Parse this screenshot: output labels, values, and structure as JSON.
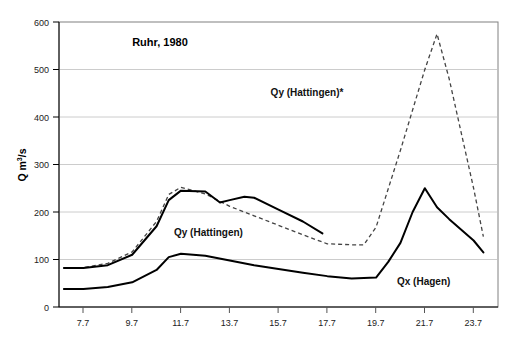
{
  "chart_data": {
    "type": "line",
    "title": "Ruhr, 1980",
    "xlabel": "",
    "ylabel": "Q m3/s",
    "ylabel_base": "Q m",
    "ylabel_sup": "3",
    "ylabel_tail": "/s",
    "xlim": [
      6.7,
      24.7
    ],
    "ylim": [
      0,
      600
    ],
    "y_ticks": [
      0,
      100,
      200,
      300,
      400,
      500,
      600
    ],
    "y_tick_labels": [
      "0",
      "100",
      "200",
      "300",
      "400",
      "500",
      "600"
    ],
    "x_ticks": [
      7.7,
      9.7,
      11.7,
      13.7,
      15.7,
      17.7,
      19.7,
      21.7,
      23.7
    ],
    "x_tick_labels": [
      "7.7",
      "9.7",
      "11.7",
      "13.7",
      "15.7",
      "17.7",
      "19.7",
      "21.7",
      "23.7"
    ],
    "grid": "horizontal",
    "legend": "inline-annotations",
    "series": [
      {
        "name": "Qy (Hattingen)",
        "style": "solid",
        "color": "#000000",
        "x": [
          6.9,
          7.7,
          8.7,
          9.7,
          10.7,
          11.2,
          11.7,
          12.7,
          13.3,
          13.7,
          14.3,
          14.7,
          15.7,
          16.7,
          17.5
        ],
        "values": [
          82,
          82,
          88,
          110,
          170,
          225,
          245,
          243,
          220,
          225,
          232,
          230,
          205,
          180,
          155
        ]
      },
      {
        "name": "Qy (Hattingen)*",
        "style": "dashed",
        "color": "#444444",
        "x": [
          6.9,
          7.7,
          8.7,
          9.7,
          10.7,
          11.2,
          11.7,
          12.7,
          13.7,
          14.7,
          15.7,
          16.7,
          17.7,
          18.7,
          19.2,
          19.7,
          20.7,
          21.7,
          22.2,
          22.7,
          23.7,
          24.1
        ],
        "values": [
          83,
          83,
          92,
          116,
          180,
          237,
          252,
          238,
          212,
          192,
          172,
          152,
          133,
          131,
          131,
          168,
          330,
          500,
          575,
          480,
          250,
          148
        ]
      },
      {
        "name": "Qx (Hagen)",
        "style": "solid",
        "color": "#000000",
        "x": [
          6.9,
          7.7,
          8.7,
          9.7,
          10.7,
          11.2,
          11.7,
          12.7,
          13.7,
          14.7,
          15.7,
          16.7,
          17.7,
          18.7,
          19.7,
          20.2,
          20.7,
          21.2,
          21.7,
          22.2,
          22.7,
          23.7,
          24.1
        ],
        "values": [
          38,
          38,
          42,
          52,
          78,
          105,
          112,
          108,
          98,
          88,
          80,
          72,
          65,
          60,
          62,
          95,
          135,
          200,
          250,
          210,
          185,
          140,
          115
        ]
      }
    ],
    "annotations": [
      {
        "text": "Ruhr, 1980",
        "x_px": 160,
        "y_px": 46,
        "role": "title"
      },
      {
        "text": "Qy (Hattingen)*",
        "x_px": 307,
        "y_px": 96,
        "role": "series-label"
      },
      {
        "text": "Qy (Hattingen)",
        "x_px": 174,
        "y_px": 236,
        "role": "series-label"
      },
      {
        "text": "Qx (Hagen)",
        "x_px": 397,
        "y_px": 285,
        "role": "series-label"
      }
    ]
  }
}
